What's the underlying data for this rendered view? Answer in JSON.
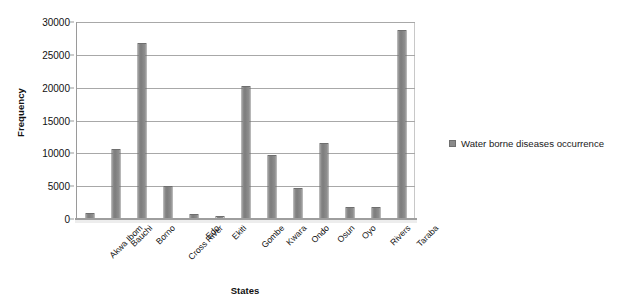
{
  "chart_data": {
    "type": "bar",
    "title": "",
    "subtitle": "",
    "xlabel": "States",
    "ylabel": "Frequency",
    "categories": [
      "Akwa Ibom",
      "Bauchi",
      "Borno",
      "Cross River",
      "Edo",
      "Ekiti",
      "Gombe",
      "Kwara",
      "Ondo",
      "Osun",
      "Oyo",
      "Rivers",
      "Taraba"
    ],
    "series": [
      {
        "name": "Water borne diseases occurrence",
        "color": "#808080",
        "values": [
          900,
          10600,
          26800,
          5000,
          800,
          400,
          20200,
          9800,
          4700,
          11600,
          1800,
          1800,
          28800
        ]
      }
    ],
    "ylim": [
      0,
      30000
    ],
    "ytick_values": [
      0,
      5000,
      10000,
      15000,
      20000,
      25000,
      30000
    ],
    "yticks": [
      "0",
      "5000",
      "10000",
      "15000",
      "20000",
      "25000",
      "30000"
    ],
    "grid": "horizontal",
    "legend_position": "right",
    "legend": [
      "Water borne diseases occurrence"
    ]
  },
  "legend": {
    "swatch_name": "legend-color-swatch",
    "label": "Water borne diseases occurrence",
    "color": "#808080"
  },
  "axes": {
    "x_title": "States",
    "y_title": "Frequency"
  }
}
